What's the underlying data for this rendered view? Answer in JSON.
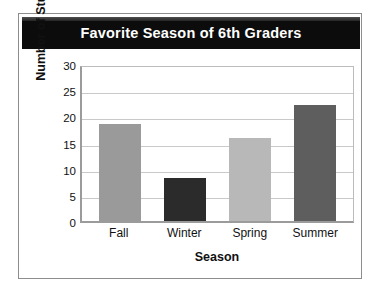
{
  "chart_data": {
    "type": "bar",
    "title": "Favorite Season of 6th Graders",
    "xlabel": "Season",
    "ylabel": "Number of Students",
    "categories": [
      "Fall",
      "Winter",
      "Spring",
      "Summer"
    ],
    "values": [
      18.5,
      8.2,
      15.8,
      22.2
    ],
    "bar_colors": [
      "#9a9a9a",
      "#2b2b2b",
      "#b8b8b8",
      "#5e5e5e"
    ],
    "ylim": [
      0,
      30
    ],
    "yticks": [
      0,
      5,
      10,
      15,
      20,
      25,
      30
    ],
    "ytick_labels": [
      "0",
      "5",
      "10",
      "15",
      "20",
      "25",
      "30"
    ],
    "grid": true,
    "grid_axis": "y",
    "legend": false,
    "title_text_color": "#ffffff",
    "title_banner_color": "#0c0c0c",
    "plot_background": "#ffffff",
    "gridline_color": "#c9c9c9",
    "axis_color": "#9b9b9b"
  }
}
